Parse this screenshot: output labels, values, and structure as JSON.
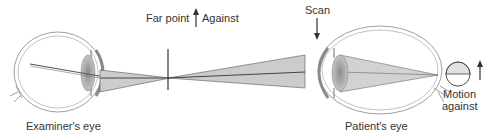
{
  "labels": {
    "examiner_eye": "Examiner's eye",
    "patient_eye": "Patient's eye",
    "far_point": "Far point",
    "against": "Against",
    "scan": "Scan",
    "motion_line1": "Motion",
    "motion_line2": "against"
  },
  "icons": {
    "against_arrow": "arrow-up",
    "scan_arrow": "arrow-down",
    "motion_arrow": "arrow-up",
    "reflex": "half-filled-circle"
  },
  "colors": {
    "outline": "#9a9a9a",
    "dark_line": "#333333",
    "beam_fill": "#c8c8c8",
    "lens_fill": "#a8a8a8",
    "text": "#333333"
  }
}
